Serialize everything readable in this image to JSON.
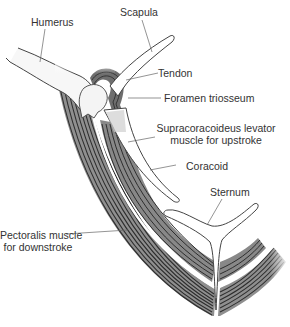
{
  "diagram": {
    "colors": {
      "background": "#ffffff",
      "outline": "#444444",
      "muscle_dark": "#3a3a3a",
      "muscle_mid": "#8a8a8a",
      "muscle_light": "#c8c8c8",
      "leader_line": "#666666",
      "label_text": "#333333"
    },
    "labels": {
      "humerus": "Humerus",
      "scapula": "Scapula",
      "tendon": "Tendon",
      "foramen": "Foramen triosseum",
      "supracoracoideus_line1": "Supracoracoideus levator",
      "supracoracoideus_line2": "muscle for upstroke",
      "coracoid": "Coracoid",
      "sternum": "Sternum",
      "pectoralis_line1": "Pectoralis muscle",
      "pectoralis_line2": "for downstroke"
    }
  }
}
